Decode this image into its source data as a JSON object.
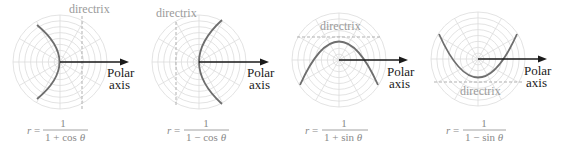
{
  "figure": {
    "panels": [
      {
        "id": "p1",
        "center": [
          60,
          62
        ],
        "radius": 47,
        "orientation": "cos_plus",
        "directrix_label": "directrix",
        "axis_label_1": "Polar",
        "axis_label_2": "axis",
        "formula": {
          "lhs": "r =",
          "numerator": "1",
          "denominator_prefix": "1 + cos ",
          "denominator_var": "θ"
        }
      },
      {
        "id": "p2",
        "center": [
          199,
          62
        ],
        "radius": 47,
        "orientation": "cos_minus",
        "directrix_label": "directrix",
        "axis_label_1": "Polar",
        "axis_label_2": "axis",
        "formula": {
          "lhs": "r =",
          "numerator": "1",
          "denominator_prefix": "1 − cos ",
          "denominator_var": "θ"
        }
      },
      {
        "id": "p3",
        "center": [
          339,
          60
        ],
        "radius": 47,
        "orientation": "sin_plus",
        "directrix_label": "directrix",
        "axis_label_1": "Polar",
        "axis_label_2": "axis",
        "formula": {
          "lhs": "r =",
          "numerator": "1",
          "denominator_prefix": "1 + sin ",
          "denominator_var": "θ"
        }
      },
      {
        "id": "p4",
        "center": [
          478,
          59
        ],
        "radius": 47,
        "orientation": "sin_minus",
        "directrix_label": "directrix",
        "axis_label_1": "Polar",
        "axis_label_2": "axis",
        "formula": {
          "lhs": "r =",
          "numerator": "1",
          "denominator_prefix": "1 − sin ",
          "denominator_var": "θ"
        }
      }
    ],
    "grid": {
      "rings": 8,
      "spokes": 12
    },
    "colors": {
      "grid": "#dcdcdc",
      "curve": "#6e6e6e",
      "directrix": "#a8a8a8",
      "axis": "#1a1a1a",
      "formula": "#8a8a8a"
    }
  }
}
